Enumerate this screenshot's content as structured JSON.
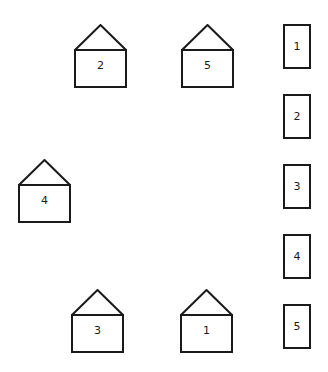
{
  "houses": [
    {
      "id": "house-2",
      "label": "2",
      "x": 74,
      "y": 24
    },
    {
      "id": "house-5",
      "label": "5",
      "x": 181,
      "y": 24
    },
    {
      "id": "house-4",
      "label": "4",
      "x": 18,
      "y": 159
    },
    {
      "id": "house-3",
      "label": "3",
      "x": 71,
      "y": 289
    },
    {
      "id": "house-1",
      "label": "1",
      "x": 180,
      "y": 289
    }
  ],
  "cards": [
    {
      "id": "card-1",
      "label": "1",
      "x": 283,
      "y": 24
    },
    {
      "id": "card-2",
      "label": "2",
      "x": 283,
      "y": 94
    },
    {
      "id": "card-3",
      "label": "3",
      "x": 283,
      "y": 164
    },
    {
      "id": "card-4",
      "label": "4",
      "x": 283,
      "y": 234
    },
    {
      "id": "card-5",
      "label": "5",
      "x": 283,
      "y": 304
    }
  ],
  "colors": {
    "stroke": "#1a1a1a",
    "background": "#ffffff"
  }
}
